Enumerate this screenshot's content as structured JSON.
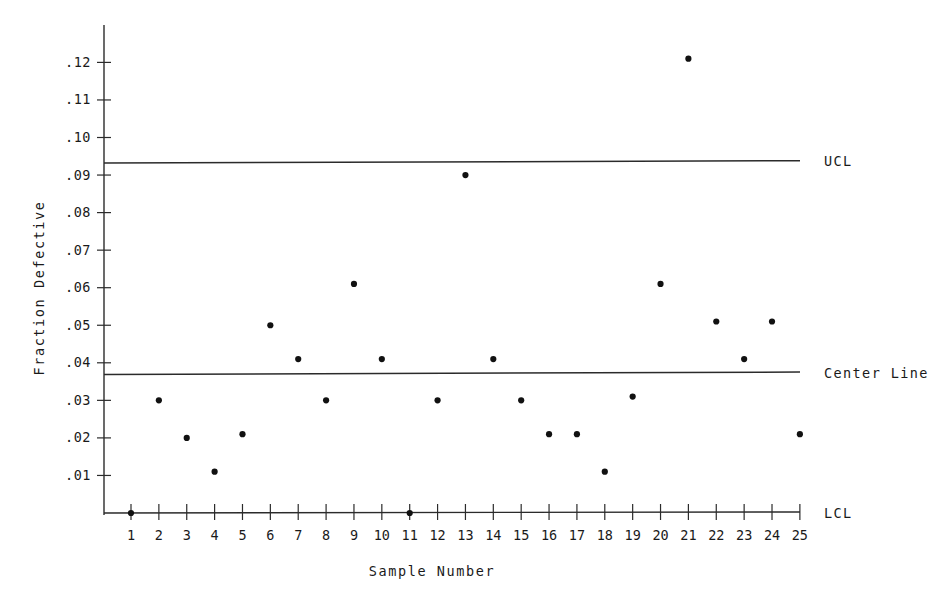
{
  "chart_data": {
    "type": "scatter",
    "title": "",
    "subtitle": "",
    "xlabel": "Sample Number",
    "ylabel": "Fraction Defective",
    "x": [
      1,
      2,
      3,
      4,
      5,
      6,
      7,
      8,
      9,
      10,
      11,
      12,
      13,
      14,
      15,
      16,
      17,
      18,
      19,
      20,
      21,
      22,
      23,
      24,
      25
    ],
    "values": [
      0.0,
      0.03,
      0.02,
      0.011,
      0.021,
      0.05,
      0.041,
      0.03,
      0.061,
      0.041,
      0.0,
      0.03,
      0.09,
      0.041,
      0.03,
      0.021,
      0.021,
      0.011,
      0.031,
      0.061,
      0.121,
      0.051,
      0.041,
      0.051,
      0.021
    ],
    "series": [
      {
        "name": "Fraction Defective",
        "values": [
          0.0,
          0.03,
          0.02,
          0.011,
          0.021,
          0.05,
          0.041,
          0.03,
          0.061,
          0.041,
          0.0,
          0.03,
          0.09,
          0.041,
          0.03,
          0.021,
          0.021,
          0.011,
          0.031,
          0.061,
          0.121,
          0.051,
          0.041,
          0.051,
          0.021
        ]
      }
    ],
    "x_tick_labels": [
      "1",
      "2",
      "3",
      "4",
      "5",
      "6",
      "7",
      "8",
      "9",
      "10",
      "11",
      "12",
      "13",
      "14",
      "15",
      "16",
      "17",
      "18",
      "19",
      "20",
      "21",
      "22",
      "23",
      "24",
      "25"
    ],
    "y_tick_labels": [
      ".12",
      ".11",
      ".10",
      ".09",
      ".08",
      ".07",
      ".06",
      ".05",
      ".04",
      ".03",
      ".02",
      ".01"
    ],
    "y_tick_values": [
      0.12,
      0.11,
      0.1,
      0.09,
      0.08,
      0.07,
      0.06,
      0.05,
      0.04,
      0.03,
      0.02,
      0.01
    ],
    "xlim": [
      0.4,
      25.6
    ],
    "ylim": [
      0.0,
      0.132
    ],
    "grid": false,
    "legend_position": "right-inline",
    "control_limits": [
      {
        "name": "UCL",
        "label": "UCL",
        "value": 0.0935
      },
      {
        "name": "center-line",
        "label": "Center Line",
        "value": 0.0372
      },
      {
        "name": "LCL",
        "label": "LCL",
        "value": 0.0
      }
    ],
    "annotations": [
      {
        "name": "out-of-control-point",
        "sample": 21,
        "value": 0.121
      }
    ],
    "colors": {
      "point": "#111111",
      "line": "#2b2b2b",
      "axis": "#2b2b2b",
      "background": "#ffffff"
    }
  }
}
